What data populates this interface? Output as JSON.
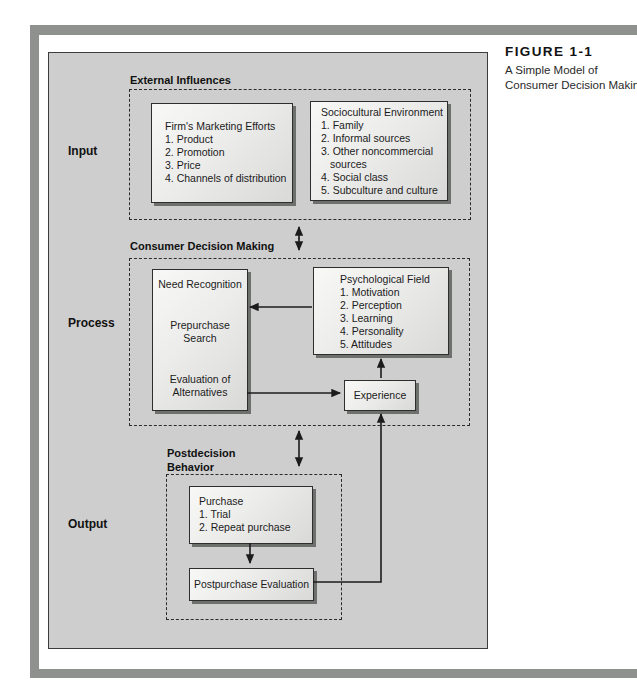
{
  "caption": {
    "figure_label": "FIGURE 1-1",
    "line1": "A Simple Model of",
    "line2": "Consumer Decision Making"
  },
  "stages": {
    "input": "Input",
    "process": "Process",
    "output": "Output"
  },
  "external": {
    "title": "External Influences",
    "firm": {
      "heading": "Firm's Marketing Efforts",
      "items": [
        "1. Product",
        "2. Promotion",
        "3. Price",
        "4. Channels of distribution"
      ]
    },
    "socio": {
      "heading": "Sociocultural Environment",
      "items": [
        "1. Family",
        "2. Informal sources",
        "3. Other noncommercial",
        "sources",
        "4. Social class",
        "5. Subculture and culture"
      ]
    }
  },
  "decision": {
    "title": "Consumer Decision Making",
    "need": {
      "lines": [
        "Need Recognition",
        "Prepurchase Search",
        "Evaluation of Alternatives"
      ]
    },
    "psych": {
      "heading": "Psychological Field",
      "items": [
        "1. Motivation",
        "2. Perception",
        "3. Learning",
        "4. Personality",
        "5. Attitudes"
      ]
    },
    "experience": "Experience"
  },
  "postdecision": {
    "title_line1": "Postdecision",
    "title_line2": "Behavior",
    "purchase": {
      "heading": "Purchase",
      "items": [
        "1. Trial",
        "2. Repeat purchase"
      ]
    },
    "postpurchase": "Postpurchase Evaluation"
  },
  "colors": {
    "frame": "#8f918f",
    "panel_bg": "#cdcecd",
    "box_border": "#2e2e2e",
    "box_shadow": "#6e706e",
    "line": "#1c1c1c"
  }
}
